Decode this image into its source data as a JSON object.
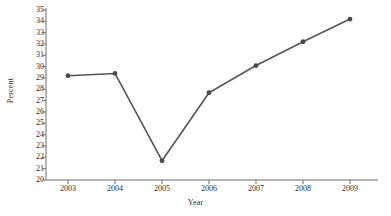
{
  "chart_data": {
    "type": "line",
    "title": "",
    "xlabel": "Year",
    "ylabel": "Percent",
    "categories": [
      "2003",
      "2004",
      "2005",
      "2006",
      "2007",
      "2008",
      "2009"
    ],
    "x": [
      2003,
      2004,
      2005,
      2006,
      2007,
      2008,
      2009
    ],
    "values": [
      29.2,
      29.4,
      21.7,
      27.7,
      30.1,
      32.2,
      34.2
    ],
    "series": [
      {
        "name": "Percent",
        "values": [
          29.2,
          29.4,
          21.7,
          27.7,
          30.1,
          32.2,
          34.2
        ]
      }
    ],
    "ylim": [
      20,
      35
    ],
    "xlim": [
      2002.6,
      2009.6
    ],
    "ytick_labels": [
      "20",
      "21",
      "22",
      "23",
      "24",
      "25",
      "26",
      "27",
      "28",
      "29",
      "30",
      "31",
      "32",
      "33",
      "34",
      "35"
    ],
    "ytick_values": [
      20,
      21,
      22,
      23,
      24,
      25,
      26,
      27,
      28,
      29,
      30,
      31,
      32,
      33,
      34,
      35
    ],
    "xtick_labels": [
      "2003",
      "2004",
      "2005",
      "2006",
      "2007",
      "2008",
      "2009"
    ],
    "grid": false,
    "legend": false,
    "legend_position": "none",
    "marker": "circle",
    "line_color": "#555555",
    "marker_color": "#4a4a4a",
    "axis_color": "#6e6e6e",
    "text_color": "#2b2b2b",
    "background_color": "#ffffff"
  }
}
